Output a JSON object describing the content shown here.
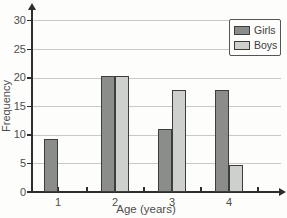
{
  "chart_data": {
    "type": "bar",
    "title": "",
    "xlabel": "Age (years)",
    "ylabel": "Frequency",
    "categories": [
      "1",
      "2",
      "3",
      "4"
    ],
    "series": [
      {
        "name": "Girls",
        "color": "#8b8d8a",
        "values": [
          9.3,
          20.2,
          11,
          17.8
        ]
      },
      {
        "name": "Boys",
        "color": "#cdd0cb",
        "values": [
          null,
          20.2,
          17.8,
          4.8
        ]
      }
    ],
    "ylim": [
      0,
      30
    ],
    "yticks": [
      0,
      5,
      10,
      15,
      20,
      25,
      30
    ],
    "grid": true,
    "gridline_color": "#c7cac5",
    "axis_color": "#2e2e2e",
    "bar_border_color": "#3d3d3d",
    "legend_position": "top-right"
  }
}
